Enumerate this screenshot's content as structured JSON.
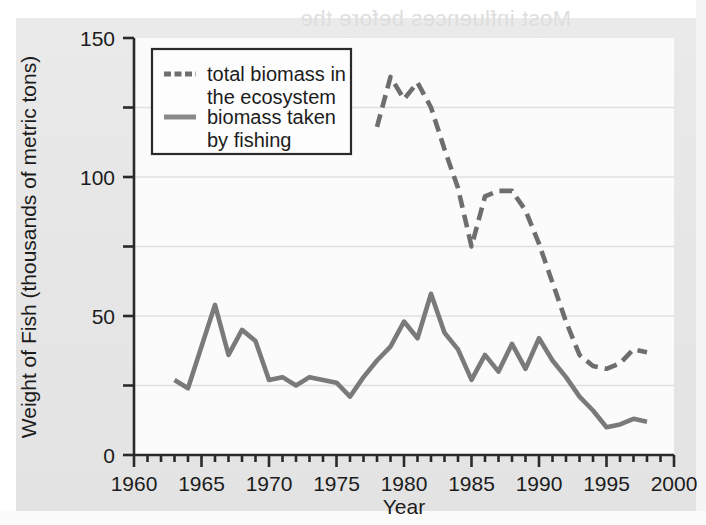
{
  "figure": {
    "background_color": "#e7e7e7",
    "plot_background_color": "#fbfbfb",
    "grid_color": "#e0e0e0",
    "axis_color": "#2a2a2a",
    "series_color_total": "#6e6e6e",
    "series_color_fishing": "#7a7a7a"
  },
  "bleedthrough": {
    "line1": "Most influences before the",
    "line2": "in recent conservation"
  },
  "legend": {
    "items": [
      {
        "label_line1": "total biomass in",
        "label_line2": "the ecosystem",
        "style": "dashed",
        "name": "total-biomass"
      },
      {
        "label_line1": "biomass taken",
        "label_line2": "by fishing",
        "style": "solid",
        "name": "biomass-fishing"
      }
    ]
  },
  "chart_data": {
    "type": "line",
    "title": "",
    "xlabel": "Year",
    "ylabel": "Weight of Fish (thousands of metric tons)",
    "xlim": [
      1960,
      2000
    ],
    "ylim": [
      0,
      150
    ],
    "xticks": [
      1960,
      1965,
      1970,
      1975,
      1980,
      1985,
      1990,
      1995,
      2000
    ],
    "xtick_labels": [
      "1960",
      "1965",
      "1970",
      "1975",
      "1980",
      "1985",
      "1990",
      "1995",
      "2000"
    ],
    "xminor_tick_interval": 1,
    "yticks": [
      0,
      50,
      100,
      150
    ],
    "ytick_labels": [
      "0",
      "50",
      "100",
      "150"
    ],
    "yminor_ticks": [
      25,
      75,
      125
    ],
    "grid": true,
    "grid_axis": "y",
    "legend_position": "upper-left-inside",
    "series": [
      {
        "name": "total biomass in the ecosystem",
        "style": "dashed",
        "color": "#6e6e6e",
        "x": [
          1978,
          1979,
          1980,
          1981,
          1982,
          1983,
          1984,
          1985,
          1986,
          1987,
          1988,
          1989,
          1990,
          1991,
          1992,
          1993,
          1994,
          1995,
          1996,
          1997,
          1998
        ],
        "y": [
          118,
          136,
          128,
          134,
          125,
          110,
          96,
          75,
          93,
          95,
          95,
          88,
          76,
          62,
          48,
          36,
          32,
          31,
          33,
          38,
          37
        ]
      },
      {
        "name": "biomass taken by fishing",
        "style": "solid",
        "color": "#7a7a7a",
        "x": [
          1963,
          1964,
          1965,
          1966,
          1967,
          1968,
          1969,
          1970,
          1971,
          1972,
          1973,
          1974,
          1975,
          1976,
          1977,
          1978,
          1979,
          1980,
          1981,
          1982,
          1983,
          1984,
          1985,
          1986,
          1987,
          1988,
          1989,
          1990,
          1991,
          1992,
          1993,
          1994,
          1995,
          1996,
          1997,
          1998
        ],
        "y": [
          27,
          24,
          39,
          54,
          36,
          45,
          41,
          27,
          28,
          25,
          28,
          27,
          26,
          21,
          28,
          34,
          39,
          48,
          42,
          58,
          44,
          38,
          27,
          36,
          30,
          40,
          31,
          42,
          34,
          28,
          21,
          16,
          10,
          11,
          13,
          12
        ]
      }
    ]
  }
}
